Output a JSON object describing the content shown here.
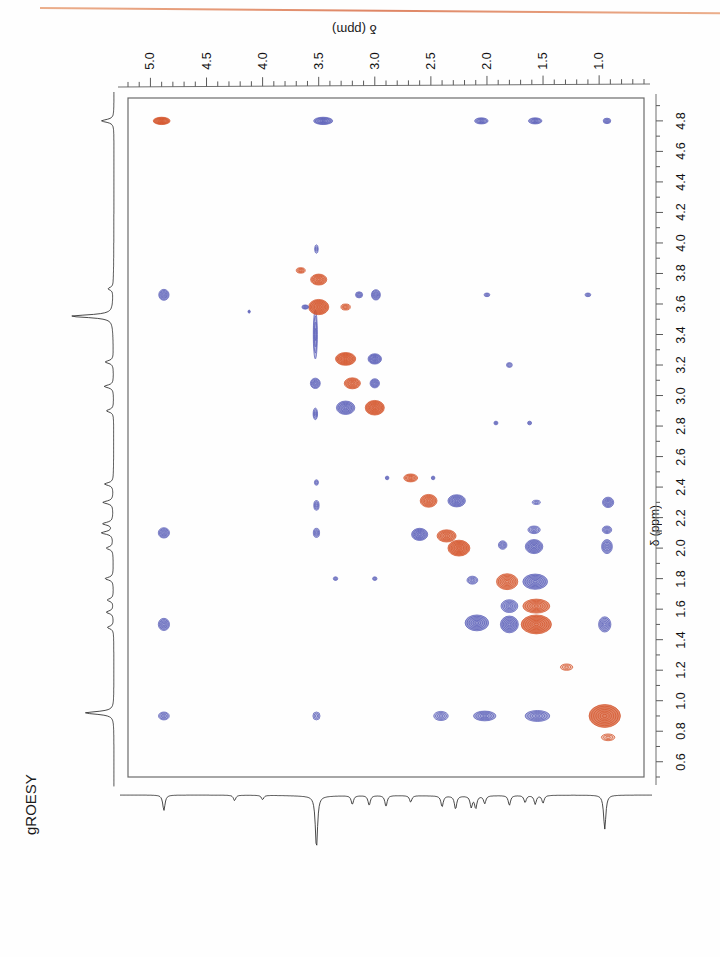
{
  "figure": {
    "experiment_label": "gROESY",
    "top_axis_title": "δ (ppm)",
    "right_axis_title": "δ (ppm)",
    "orientation": "rotated-180",
    "colors": {
      "positive_contour": "#d4552b",
      "negative_contour": "#5a5fb8",
      "frame": "#6b6b6b",
      "trace": "#2b2b2b",
      "scan_artifact": "#d9704a",
      "background": "#fefefe"
    },
    "plot_box": {
      "x": 128,
      "y": 98,
      "width": 516,
      "height": 679
    }
  },
  "top_axis": {
    "name": "f2-axis",
    "labels": [
      "1.0",
      "1.5",
      "2.0",
      "2.5",
      "3.0",
      "3.5",
      "4.0",
      "4.5",
      "5.0"
    ],
    "values": [
      1.0,
      1.5,
      2.0,
      2.5,
      3.0,
      3.5,
      4.0,
      4.5,
      5.0
    ],
    "range": [
      0.6,
      5.2
    ],
    "minor_step": 0.1,
    "major_step": 0.5,
    "direction": "decreasing-left-to-right-after-rotation"
  },
  "right_axis": {
    "name": "f1-axis",
    "labels": [
      "0.6",
      "0.8",
      "1.0",
      "1.2",
      "1.4",
      "1.6",
      "1.8",
      "2.0",
      "2.2",
      "2.4",
      "2.6",
      "2.8",
      "3.0",
      "3.2",
      "3.4",
      "3.6",
      "3.8",
      "4.0",
      "4.2",
      "4.4",
      "4.6",
      "4.8"
    ],
    "values": [
      0.6,
      0.8,
      1.0,
      1.2,
      1.4,
      1.6,
      1.8,
      2.0,
      2.2,
      2.4,
      2.6,
      2.8,
      3.0,
      3.2,
      3.4,
      3.6,
      3.8,
      4.0,
      4.2,
      4.4,
      4.6,
      4.8
    ],
    "range": [
      0.5,
      4.95
    ],
    "major_step": 0.2
  },
  "chart_data": {
    "type": "heatmap",
    "title": "gROESY",
    "xlabel": "δ (ppm)",
    "ylabel": "δ (ppm)",
    "xlim": [
      0.6,
      5.2
    ],
    "ylim": [
      0.5,
      4.95
    ],
    "grid": false,
    "legend": "none",
    "peaks": [
      {
        "f2": 0.95,
        "f1": 0.9,
        "sign": "pos",
        "i": 5,
        "rx": 0.14,
        "ry": 0.075
      },
      {
        "f2": 0.92,
        "f1": 0.76,
        "sign": "pos",
        "i": 1,
        "rx": 0.06,
        "ry": 0.022
      },
      {
        "f2": 1.55,
        "f1": 0.9,
        "sign": "neg",
        "i": 3,
        "rx": 0.11,
        "ry": 0.036
      },
      {
        "f2": 2.02,
        "f1": 0.9,
        "sign": "neg",
        "i": 3,
        "rx": 0.1,
        "ry": 0.032
      },
      {
        "f2": 2.41,
        "f1": 0.9,
        "sign": "neg",
        "i": 2,
        "rx": 0.065,
        "ry": 0.03
      },
      {
        "f2": 3.52,
        "f1": 0.9,
        "sign": "neg",
        "i": 1,
        "rx": 0.032,
        "ry": 0.026
      },
      {
        "f2": 4.88,
        "f1": 0.9,
        "sign": "neg",
        "i": 2,
        "rx": 0.048,
        "ry": 0.026
      },
      {
        "f2": 1.29,
        "f1": 1.22,
        "sign": "pos",
        "i": 1,
        "rx": 0.055,
        "ry": 0.021
      },
      {
        "f2": 0.95,
        "f1": 1.5,
        "sign": "neg",
        "i": 3,
        "rx": 0.055,
        "ry": 0.05
      },
      {
        "f2": 1.56,
        "f1": 1.5,
        "sign": "pos",
        "i": 5,
        "rx": 0.135,
        "ry": 0.062
      },
      {
        "f2": 1.8,
        "f1": 1.5,
        "sign": "neg",
        "i": 4,
        "rx": 0.08,
        "ry": 0.055
      },
      {
        "f2": 2.09,
        "f1": 1.51,
        "sign": "neg",
        "i": 4,
        "rx": 0.105,
        "ry": 0.052
      },
      {
        "f2": 4.88,
        "f1": 1.5,
        "sign": "neg",
        "i": 3,
        "rx": 0.05,
        "ry": 0.04
      },
      {
        "f2": 1.56,
        "f1": 1.62,
        "sign": "pos",
        "i": 4,
        "rx": 0.12,
        "ry": 0.046
      },
      {
        "f2": 1.8,
        "f1": 1.62,
        "sign": "neg",
        "i": 3,
        "rx": 0.075,
        "ry": 0.042
      },
      {
        "f2": 1.57,
        "f1": 1.78,
        "sign": "neg",
        "i": 4,
        "rx": 0.11,
        "ry": 0.05
      },
      {
        "f2": 1.82,
        "f1": 1.78,
        "sign": "pos",
        "i": 4,
        "rx": 0.095,
        "ry": 0.052
      },
      {
        "f2": 2.13,
        "f1": 1.79,
        "sign": "neg",
        "i": 2,
        "rx": 0.048,
        "ry": 0.026
      },
      {
        "f2": 3.0,
        "f1": 1.8,
        "sign": "neg",
        "i": 1,
        "rx": 0.02,
        "ry": 0.012
      },
      {
        "f2": 3.35,
        "f1": 1.8,
        "sign": "neg",
        "i": 1,
        "rx": 0.02,
        "ry": 0.012
      },
      {
        "f2": 0.93,
        "f1": 2.01,
        "sign": "neg",
        "i": 3,
        "rx": 0.048,
        "ry": 0.046
      },
      {
        "f2": 1.58,
        "f1": 2.01,
        "sign": "neg",
        "i": 4,
        "rx": 0.078,
        "ry": 0.046
      },
      {
        "f2": 1.86,
        "f1": 2.02,
        "sign": "neg",
        "i": 2,
        "rx": 0.038,
        "ry": 0.028
      },
      {
        "f2": 2.25,
        "f1": 2.0,
        "sign": "pos",
        "i": 5,
        "rx": 0.098,
        "ry": 0.052
      },
      {
        "f2": 2.36,
        "f1": 2.08,
        "sign": "pos",
        "i": 4,
        "rx": 0.085,
        "ry": 0.04
      },
      {
        "f2": 2.6,
        "f1": 2.09,
        "sign": "neg",
        "i": 4,
        "rx": 0.072,
        "ry": 0.04
      },
      {
        "f2": 0.93,
        "f1": 2.12,
        "sign": "neg",
        "i": 2,
        "rx": 0.042,
        "ry": 0.025
      },
      {
        "f2": 1.58,
        "f1": 2.12,
        "sign": "neg",
        "i": 2,
        "rx": 0.055,
        "ry": 0.025
      },
      {
        "f2": 3.52,
        "f1": 2.1,
        "sign": "neg",
        "i": 2,
        "rx": 0.028,
        "ry": 0.03
      },
      {
        "f2": 4.88,
        "f1": 2.1,
        "sign": "neg",
        "i": 3,
        "rx": 0.05,
        "ry": 0.034
      },
      {
        "f2": 0.92,
        "f1": 2.3,
        "sign": "neg",
        "i": 3,
        "rx": 0.05,
        "ry": 0.034
      },
      {
        "f2": 1.56,
        "f1": 2.3,
        "sign": "neg",
        "i": 1,
        "rx": 0.036,
        "ry": 0.014
      },
      {
        "f2": 2.27,
        "f1": 2.31,
        "sign": "neg",
        "i": 4,
        "rx": 0.078,
        "ry": 0.04
      },
      {
        "f2": 2.52,
        "f1": 2.31,
        "sign": "pos",
        "i": 4,
        "rx": 0.075,
        "ry": 0.042
      },
      {
        "f2": 3.52,
        "f1": 2.28,
        "sign": "neg",
        "i": 2,
        "rx": 0.024,
        "ry": 0.032
      },
      {
        "f2": 2.68,
        "f1": 2.46,
        "sign": "pos",
        "i": 3,
        "rx": 0.062,
        "ry": 0.026
      },
      {
        "f2": 2.48,
        "f1": 2.46,
        "sign": "neg",
        "i": 1,
        "rx": 0.016,
        "ry": 0.012
      },
      {
        "f2": 2.89,
        "f1": 2.46,
        "sign": "neg",
        "i": 1,
        "rx": 0.016,
        "ry": 0.012
      },
      {
        "f2": 3.52,
        "f1": 2.43,
        "sign": "neg",
        "i": 1,
        "rx": 0.018,
        "ry": 0.018
      },
      {
        "f2": 1.62,
        "f1": 2.82,
        "sign": "neg",
        "i": 1,
        "rx": 0.018,
        "ry": 0.012
      },
      {
        "f2": 1.92,
        "f1": 2.82,
        "sign": "neg",
        "i": 1,
        "rx": 0.018,
        "ry": 0.012
      },
      {
        "f2": 3.0,
        "f1": 2.92,
        "sign": "pos",
        "i": 5,
        "rx": 0.085,
        "ry": 0.048
      },
      {
        "f2": 3.26,
        "f1": 2.92,
        "sign": "neg",
        "i": 4,
        "rx": 0.082,
        "ry": 0.044
      },
      {
        "f2": 3.53,
        "f1": 2.88,
        "sign": "neg",
        "i": 2,
        "rx": 0.02,
        "ry": 0.038
      },
      {
        "f2": 3.0,
        "f1": 3.08,
        "sign": "neg",
        "i": 3,
        "rx": 0.042,
        "ry": 0.03
      },
      {
        "f2": 3.2,
        "f1": 3.08,
        "sign": "pos",
        "i": 4,
        "rx": 0.072,
        "ry": 0.036
      },
      {
        "f2": 3.53,
        "f1": 3.08,
        "sign": "neg",
        "i": 3,
        "rx": 0.044,
        "ry": 0.034
      },
      {
        "f2": 3.0,
        "f1": 3.24,
        "sign": "neg",
        "i": 4,
        "rx": 0.06,
        "ry": 0.034
      },
      {
        "f2": 3.26,
        "f1": 3.24,
        "sign": "pos",
        "i": 5,
        "rx": 0.09,
        "ry": 0.042
      },
      {
        "f2": 1.8,
        "f1": 3.2,
        "sign": "neg",
        "i": 1,
        "rx": 0.026,
        "ry": 0.016
      },
      {
        "f2": 3.53,
        "f1": 3.4,
        "sign": "neg",
        "i": 2,
        "rx": 0.018,
        "ry": 0.16
      },
      {
        "f2": 3.5,
        "f1": 3.58,
        "sign": "pos",
        "i": 5,
        "rx": 0.09,
        "ry": 0.05
      },
      {
        "f2": 3.26,
        "f1": 3.58,
        "sign": "pos",
        "i": 2,
        "rx": 0.042,
        "ry": 0.02
      },
      {
        "f2": 3.62,
        "f1": 3.58,
        "sign": "neg",
        "i": 2,
        "rx": 0.03,
        "ry": 0.014
      },
      {
        "f2": 2.99,
        "f1": 3.66,
        "sign": "neg",
        "i": 3,
        "rx": 0.04,
        "ry": 0.034
      },
      {
        "f2": 3.14,
        "f1": 3.66,
        "sign": "neg",
        "i": 2,
        "rx": 0.032,
        "ry": 0.02
      },
      {
        "f2": 1.1,
        "f1": 3.66,
        "sign": "neg",
        "i": 1,
        "rx": 0.026,
        "ry": 0.012
      },
      {
        "f2": 2.0,
        "f1": 3.66,
        "sign": "neg",
        "i": 1,
        "rx": 0.026,
        "ry": 0.012
      },
      {
        "f2": 4.88,
        "f1": 3.66,
        "sign": "neg",
        "i": 3,
        "rx": 0.046,
        "ry": 0.036
      },
      {
        "f2": 3.5,
        "f1": 3.76,
        "sign": "pos",
        "i": 4,
        "rx": 0.072,
        "ry": 0.036
      },
      {
        "f2": 3.66,
        "f1": 3.82,
        "sign": "pos",
        "i": 2,
        "rx": 0.04,
        "ry": 0.018
      },
      {
        "f2": 3.52,
        "f1": 3.96,
        "sign": "neg",
        "i": 1,
        "rx": 0.016,
        "ry": 0.028
      },
      {
        "f2": 4.12,
        "f1": 3.55,
        "sign": "neg",
        "i": 1,
        "rx": 0.01,
        "ry": 0.01
      },
      {
        "f2": 0.93,
        "f1": 4.8,
        "sign": "neg",
        "i": 2,
        "rx": 0.034,
        "ry": 0.018
      },
      {
        "f2": 1.57,
        "f1": 4.8,
        "sign": "neg",
        "i": 3,
        "rx": 0.06,
        "ry": 0.02
      },
      {
        "f2": 2.05,
        "f1": 4.8,
        "sign": "neg",
        "i": 3,
        "rx": 0.06,
        "ry": 0.02
      },
      {
        "f2": 3.46,
        "f1": 4.8,
        "sign": "neg",
        "i": 4,
        "rx": 0.085,
        "ry": 0.024
      },
      {
        "f2": 4.9,
        "f1": 4.8,
        "sign": "pos",
        "i": 5,
        "rx": 0.075,
        "ry": 0.024
      }
    ],
    "projection_f2": {
      "name": "bottom-1d-trace",
      "direction": "inverted",
      "peaks_ppm": [
        0.95,
        1.5,
        1.57,
        1.66,
        1.8,
        2.02,
        2.1,
        2.14,
        2.28,
        2.4,
        2.68,
        2.9,
        3.05,
        3.2,
        3.52,
        4.0,
        4.25,
        4.88
      ],
      "peak_heights": [
        62,
        14,
        16,
        13,
        18,
        14,
        22,
        20,
        24,
        20,
        12,
        20,
        18,
        16,
        95,
        8,
        10,
        28
      ]
    },
    "projection_f1": {
      "name": "left-1d-trace",
      "direction": "inverted",
      "peaks_ppm": [
        0.92,
        1.48,
        1.58,
        1.66,
        1.8,
        2.0,
        2.1,
        2.16,
        2.3,
        2.42,
        2.9,
        3.06,
        3.22,
        3.52,
        3.7,
        4.8
      ],
      "peak_heights": [
        55,
        12,
        14,
        12,
        16,
        13,
        22,
        20,
        20,
        17,
        14,
        18,
        16,
        80,
        10,
        24
      ]
    }
  }
}
